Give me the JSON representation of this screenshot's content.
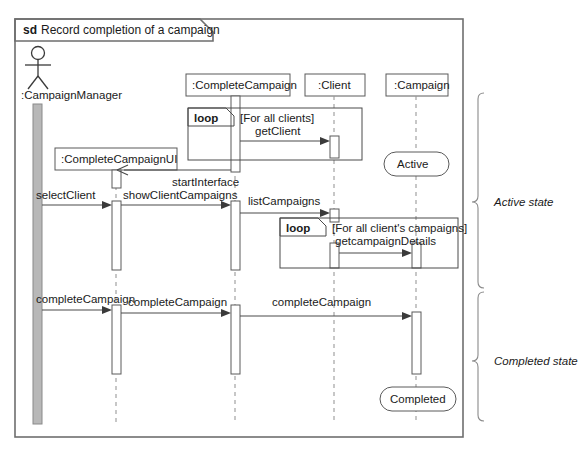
{
  "frame": {
    "keyword": "sd",
    "title": "Record completion of a campaign"
  },
  "actor": {
    "name": ":CampaignManager",
    "icon": "actor-stick-figure"
  },
  "lifelines": [
    {
      "id": "campaignmanager",
      "label": ":CampaignManager",
      "kind": "actor"
    },
    {
      "id": "completecampaignui",
      "label": ":CompleteCampaignUI",
      "kind": "object"
    },
    {
      "id": "completecampaign",
      "label": ":CompleteCampaign",
      "kind": "object"
    },
    {
      "id": "client",
      "label": ":Client",
      "kind": "object"
    },
    {
      "id": "campaign",
      "label": ":Campaign",
      "kind": "object"
    }
  ],
  "fragments": [
    {
      "id": "loop-clients",
      "operator": "loop",
      "guard": "[For all clients]"
    },
    {
      "id": "loop-campaigns",
      "operator": "loop",
      "guard": "[For all client's campaigns]"
    }
  ],
  "messages": [
    {
      "id": "getclient",
      "label": "getClient",
      "from": "completecampaign",
      "to": "client"
    },
    {
      "id": "startinterface",
      "label": "startInterface",
      "from": "completecampaign",
      "to": "completecampaignui"
    },
    {
      "id": "selectclient",
      "label": "selectClient",
      "from": "campaignmanager",
      "to": "completecampaignui"
    },
    {
      "id": "showclientcampaigns",
      "label": "showClientCampaigns",
      "from": "completecampaignui",
      "to": "completecampaign"
    },
    {
      "id": "listcampaigns",
      "label": "listCampaigns",
      "from": "completecampaign",
      "to": "client"
    },
    {
      "id": "getcampaigndetails",
      "label": "getcampaignDetails",
      "from": "client",
      "to": "campaign"
    },
    {
      "id": "completecampaign-1",
      "label": "completeCampaign",
      "from": "campaignmanager",
      "to": "completecampaignui"
    },
    {
      "id": "completecampaign-2",
      "label": "completeCampaign",
      "from": "completecampaignui",
      "to": "completecampaign"
    },
    {
      "id": "completecampaign-3",
      "label": "completeCampaign",
      "from": "completecampaign",
      "to": "campaign"
    }
  ],
  "states": [
    {
      "id": "state-active",
      "label": "Active",
      "lifeline": "campaign"
    },
    {
      "id": "state-completed",
      "label": "Completed",
      "lifeline": "campaign"
    }
  ],
  "annotations": [
    {
      "id": "brace-active",
      "label": "Active state"
    },
    {
      "id": "brace-completed",
      "label": "Completed state"
    }
  ],
  "colors": {
    "stroke": "#4a4a4a",
    "frame_stroke": "#6e6e6e",
    "dash_stroke": "#9a9a9a",
    "actor_bar_fill": "#b8b8b8",
    "background": "#ffffff",
    "text": "#1a1a1a"
  }
}
